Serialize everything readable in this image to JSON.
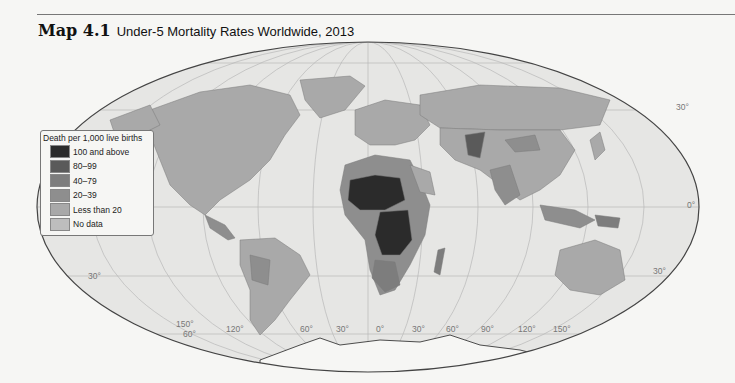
{
  "header": {
    "map_number": "Map 4.1",
    "title": "Under-5 Mortality Rates Worldwide, 2013"
  },
  "legend": {
    "title": "Death per 1,000 live births",
    "items": [
      {
        "label": "100 and above",
        "color": "#2b2b2b"
      },
      {
        "label": "80–99",
        "color": "#5a5a5a"
      },
      {
        "label": "40–79",
        "color": "#7d7d7d"
      },
      {
        "label": "20–39",
        "color": "#8e8e8e"
      },
      {
        "label": "Less than 20",
        "color": "#a9a9a9"
      },
      {
        "label": "No data",
        "color": "#bdbdbd"
      }
    ]
  },
  "graticule": {
    "latitude_labels": {
      "n30": "30°",
      "eq": "0°",
      "s30_right": "30°",
      "s30_left": "30°",
      "s60": "60°"
    },
    "longitude_labels": [
      "150°",
      "120°",
      "90°",
      "60°",
      "30°",
      "0°",
      "30°",
      "60°",
      "90°",
      "120°",
      "150°"
    ]
  },
  "colors": {
    "ocean": "#e6e6e4",
    "land_low": "#a9a9a9",
    "land_mid": "#8e8e8e",
    "land_high": "#5a5a5a",
    "land_highest": "#2b2b2b",
    "graticule": "#b5b5b5",
    "outline": "#444444"
  }
}
